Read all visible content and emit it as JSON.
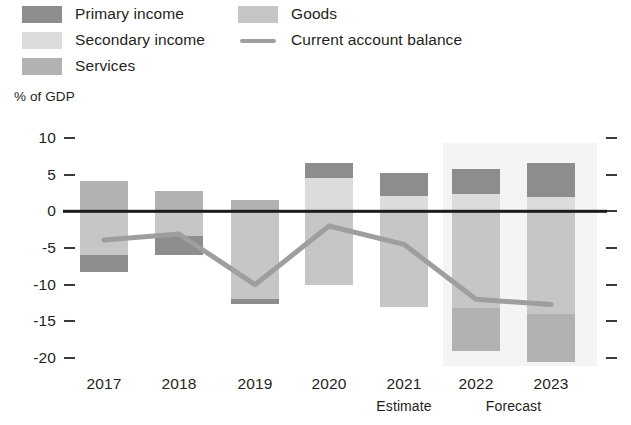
{
  "chart_data": {
    "type": "bar",
    "title": "",
    "subtitle": "",
    "xlabel": "",
    "ylabel": "% of GDP",
    "ylim": [
      -20,
      10
    ],
    "yticks": [
      10,
      5,
      0,
      -5,
      -10,
      -15,
      -20
    ],
    "ytick_labels": [
      "10",
      "5",
      "0",
      "-5",
      "-10",
      "-15",
      "-20"
    ],
    "grid": false,
    "legend_position": "top",
    "stacked": true,
    "categories": [
      "2017",
      "2018",
      "2019",
      "2020",
      "2021",
      "2022",
      "2023"
    ],
    "category_notes": [
      "",
      "",
      "",
      "",
      "Estimate",
      "Forecast",
      "Forecast"
    ],
    "forecast_from": "2022",
    "series": [
      {
        "name": "Primary income",
        "color": "#8d8d8d",
        "values": [
          -2.3,
          -2.7,
          -0.6,
          2.0,
          3.1,
          3.4,
          4.7
        ]
      },
      {
        "name": "Secondary income",
        "color": "#dcdcdc",
        "values": [
          0.0,
          0.0,
          0.0,
          4.6,
          2.1,
          2.4,
          1.9
        ]
      },
      {
        "name": "Services",
        "color": "#b2b2b2",
        "values": [
          4.1,
          2.8,
          1.5,
          0.0,
          0.0,
          -5.8,
          -6.5
        ]
      },
      {
        "name": "Goods",
        "color": "#c6c6c6",
        "values": [
          -6.0,
          -3.3,
          -12.0,
          -10.0,
          -13.0,
          -13.2,
          -14.0
        ]
      }
    ],
    "line_series": {
      "name": "Current account balance",
      "color": "#9e9e9e",
      "values": [
        -3.9,
        -3.1,
        -10.0,
        -2.0,
        -4.5,
        -12.0,
        -12.7
      ]
    }
  },
  "legend": {
    "items": [
      {
        "label": "Primary income",
        "swatch": "swatch-primary-income",
        "type": "box"
      },
      {
        "label": "Secondary income",
        "swatch": "swatch-secondary-income",
        "type": "box"
      },
      {
        "label": "Services",
        "swatch": "swatch-services",
        "type": "box"
      },
      {
        "label": "Goods",
        "swatch": "swatch-goods",
        "type": "box"
      },
      {
        "label": "Current account balance",
        "swatch": "swatch-line",
        "type": "line"
      }
    ]
  },
  "colors": {
    "primary_income": "#8d8d8d",
    "secondary_income": "#dcdcdc",
    "services": "#b2b2b2",
    "goods": "#c6c6c6",
    "line": "#9e9e9e",
    "axis": "#1b1b1b",
    "forecast_band": "#f4f4f4",
    "text": "#231f20"
  }
}
